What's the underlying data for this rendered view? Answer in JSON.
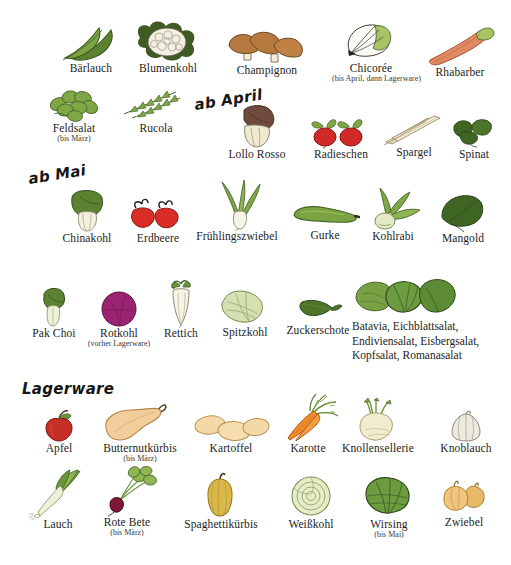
{
  "poster": {
    "background": "#ffffff",
    "text_color": "#1d1d1b"
  },
  "sections": [
    {
      "id": "ab-april",
      "heading": "ab April",
      "x": 196,
      "y": 118,
      "tilt": true
    },
    {
      "id": "ab-mai",
      "heading": "ab Mai",
      "x": 30,
      "y": 192,
      "tilt": true
    },
    {
      "id": "lagerware",
      "heading": "Lagerware",
      "x": 22,
      "y": 396,
      "tilt": false
    }
  ],
  "rows": [
    {
      "id": "row-1",
      "items": [
        {
          "name": "Bärlauch",
          "sub": "",
          "icon": "ramsons-leaves",
          "x": 55,
          "y": 22,
          "w": 72,
          "label_y": 64
        },
        {
          "name": "Blumenkohl",
          "sub": "",
          "icon": "cauliflower",
          "x": 128,
          "y": 20,
          "w": 80,
          "label_y": 64
        },
        {
          "name": "Champignon",
          "sub": "",
          "icon": "mushrooms",
          "x": 224,
          "y": 28,
          "w": 86,
          "label_y": 64
        },
        {
          "name": "Chicorée",
          "sub": "(bis April, dann\nLagerware)",
          "icon": "chicory",
          "x": 332,
          "y": 22,
          "w": 78,
          "label_y": 64
        },
        {
          "name": "Rhabarber",
          "sub": "",
          "icon": "rhubarb",
          "x": 420,
          "y": 26,
          "w": 80,
          "label_y": 64
        }
      ]
    },
    {
      "id": "row-2",
      "items": [
        {
          "name": "Feldsalat",
          "sub": "(bis März)",
          "icon": "lambs-lettuce",
          "x": 38,
          "y": 88,
          "w": 72,
          "label_y": 122
        },
        {
          "name": "Rucola",
          "sub": "",
          "icon": "rocket",
          "x": 118,
          "y": 90,
          "w": 76,
          "label_y": 122
        },
        {
          "name": "Lollo Rosso",
          "sub": "",
          "icon": "lollo-rosso",
          "x": 214,
          "y": 104,
          "w": 86,
          "label_y": 148
        },
        {
          "name": "Radieschen",
          "sub": "",
          "icon": "radishes",
          "x": 303,
          "y": 120,
          "w": 76,
          "label_y": 148
        },
        {
          "name": "Spargel",
          "sub": "",
          "icon": "asparagus",
          "x": 382,
          "y": 118,
          "w": 64,
          "label_y": 148
        },
        {
          "name": "Spinat",
          "sub": "",
          "icon": "spinach",
          "x": 444,
          "y": 120,
          "w": 60,
          "label_y": 148
        }
      ]
    },
    {
      "id": "row-3",
      "items": [
        {
          "name": "Chinakohl",
          "sub": "",
          "icon": "napa-cabbage",
          "x": 50,
          "y": 188,
          "w": 74,
          "label_y": 230
        },
        {
          "name": "Erdbeere",
          "sub": "",
          "icon": "strawberries",
          "x": 124,
          "y": 200,
          "w": 68,
          "label_y": 230
        },
        {
          "name": "Frühlingszwiebel",
          "sub": "",
          "icon": "spring-onion",
          "x": 188,
          "y": 182,
          "w": 98,
          "label_y": 230
        },
        {
          "name": "Gurke",
          "sub": "",
          "icon": "cucumber",
          "x": 288,
          "y": 203,
          "w": 74,
          "label_y": 230
        },
        {
          "name": "Kohlrabi",
          "sub": "",
          "icon": "kohlrabi",
          "x": 358,
          "y": 190,
          "w": 70,
          "label_y": 230
        },
        {
          "name": "Mangold",
          "sub": "",
          "icon": "chard",
          "x": 428,
          "y": 196,
          "w": 70,
          "label_y": 230
        }
      ]
    },
    {
      "id": "row-4",
      "items": [
        {
          "name": "Pak Choi",
          "sub": "",
          "icon": "pak-choi",
          "x": 18,
          "y": 285,
          "w": 72,
          "label_y": 326
        },
        {
          "name": "Rotkohl",
          "sub": "(vorher\nLagerware)",
          "icon": "red-cabbage",
          "x": 86,
          "y": 285,
          "w": 66,
          "label_y": 326
        },
        {
          "name": "Rettich",
          "sub": "",
          "icon": "daikon",
          "x": 150,
          "y": 281,
          "w": 62,
          "label_y": 326
        },
        {
          "name": "Spitzkohl",
          "sub": "",
          "icon": "pointed-cabbage",
          "x": 210,
          "y": 288,
          "w": 70,
          "label_y": 326
        },
        {
          "name": "Zuckerschote",
          "sub": "",
          "icon": "snow-pea",
          "x": 276,
          "y": 296,
          "w": 84,
          "label_y": 326
        }
      ],
      "group": {
        "icon": "mixed-salads",
        "x": 352,
        "y": 278,
        "w": 150,
        "label_x": 352,
        "label_y": 321,
        "text": "Batavia, Eichblattsalat,\nEndiviensalat, Eisbergsalat,\nKopfsalat, Romanasalat"
      }
    },
    {
      "id": "row-5",
      "items": [
        {
          "name": "Apfel",
          "sub": "",
          "icon": "apple",
          "x": 28,
          "y": 412,
          "w": 62,
          "label_y": 442
        },
        {
          "name": "Butternutkürbis",
          "sub": "(bis März)",
          "icon": "butternut-squash",
          "x": 92,
          "y": 404,
          "w": 96,
          "label_y": 442
        },
        {
          "name": "Kartoffel",
          "sub": "",
          "icon": "potatoes",
          "x": 190,
          "y": 414,
          "w": 82,
          "label_y": 442
        },
        {
          "name": "Karotte",
          "sub": "",
          "icon": "carrots",
          "x": 272,
          "y": 396,
          "w": 72,
          "label_y": 442
        },
        {
          "name": "Knollensellerie",
          "sub": "",
          "icon": "celeriac",
          "x": 326,
          "y": 400,
          "w": 104,
          "label_y": 442
        },
        {
          "name": "Knoblauch",
          "sub": "",
          "icon": "garlic",
          "x": 428,
          "y": 410,
          "w": 76,
          "label_y": 442
        }
      ]
    },
    {
      "id": "row-6",
      "items": [
        {
          "name": "Lauch",
          "sub": "",
          "icon": "leek",
          "x": 26,
          "y": 472,
          "w": 64,
          "label_y": 518
        },
        {
          "name": "Rote Bete",
          "sub": "(bis März)",
          "icon": "beetroot",
          "x": 90,
          "y": 468,
          "w": 74,
          "label_y": 518
        },
        {
          "name": "Spaghettikürbis",
          "sub": "",
          "icon": "spaghetti-squash",
          "x": 172,
          "y": 474,
          "w": 98,
          "label_y": 518
        },
        {
          "name": "Weißkohl",
          "sub": "",
          "icon": "white-cabbage",
          "x": 272,
          "y": 476,
          "w": 78,
          "label_y": 518
        },
        {
          "name": "Wirsing",
          "sub": "(bis Mai)",
          "icon": "savoy-cabbage",
          "x": 352,
          "y": 476,
          "w": 74,
          "label_y": 518
        },
        {
          "name": "Zwiebel",
          "sub": "",
          "icon": "onions",
          "x": 428,
          "y": 480,
          "w": 72,
          "label_y": 518
        }
      ]
    }
  ],
  "colors": {
    "leaf_dark": "#3f5a22",
    "leaf_mid": "#6a8f3c",
    "leaf_light": "#9dbd63",
    "cabbage_pale": "#cddcae",
    "mushroom": "#b5793f",
    "rhubarb": "#e08a63",
    "red": "#cf2a28",
    "magenta": "#9b2472",
    "orange": "#ef8a2a",
    "tan": "#f0cd9a",
    "cream": "#efe5c4",
    "ink": "#1d1d1b",
    "squash_yellow": "#d9b74a",
    "beet": "#7d1733"
  }
}
